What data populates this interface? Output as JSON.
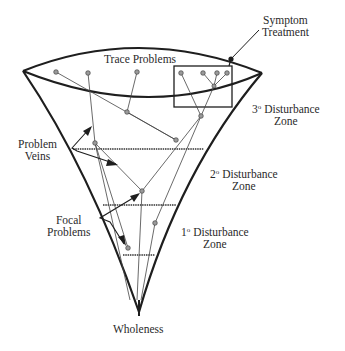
{
  "diagram": {
    "labels": {
      "symptom_treatment": [
        "Symptom",
        "Treatment"
      ],
      "trace_problems": "Trace Problems",
      "zone3": {
        "num": "3",
        "deg": "o",
        "line1": " Disturbance",
        "line2": "Zone"
      },
      "zone2": {
        "num": "2",
        "deg": "o",
        "line1": " Disturbance",
        "line2": "Zone"
      },
      "zone1": {
        "num": "1",
        "deg": "o",
        "line1": " Disturbance",
        "line2": "Zone"
      },
      "problem_veins": [
        "Problem",
        "Veins"
      ],
      "focal_problems": [
        "Focal",
        "Problems"
      ],
      "wholeness": "Wholeness"
    },
    "nodes": {
      "trace": [
        [
          56,
          72
        ],
        [
          88,
          73
        ],
        [
          137,
          72
        ]
      ],
      "symptom_box": [
        [
          181,
          73
        ],
        [
          203,
          73
        ],
        [
          217,
          73
        ],
        [
          227,
          73
        ]
      ],
      "inner": [
        [
          127,
          112
        ],
        [
          214,
          86
        ],
        [
          201,
          116
        ],
        [
          176,
          140
        ],
        [
          95,
          143
        ],
        [
          142,
          191
        ],
        [
          155,
          223
        ],
        [
          128,
          248
        ]
      ]
    },
    "colors": {
      "line": "#1e1e1e",
      "thin_line": "#444444",
      "node_fill": "#9a9a9a",
      "text": "#2a2a2a"
    }
  }
}
